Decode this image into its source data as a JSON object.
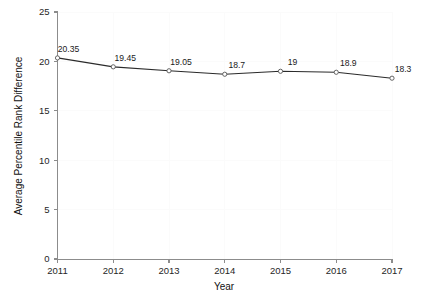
{
  "chart_data": {
    "type": "line",
    "title": "",
    "xlabel": "Year",
    "ylabel": "Average Percentile Rank Difference",
    "categories": [
      "2011",
      "2012",
      "2013",
      "2014",
      "2015",
      "2016",
      "2017"
    ],
    "values": [
      20.35,
      19.45,
      19.05,
      18.7,
      19,
      18.9,
      18.3
    ],
    "point_labels": [
      "20.35",
      "19.45",
      "19.05",
      "18.7",
      "19",
      "18.9",
      "18.3"
    ],
    "ylim": [
      0,
      25
    ],
    "y_ticks": [
      "0",
      "5",
      "10",
      "15",
      "20",
      "25"
    ],
    "y_tick_values": [
      0,
      5,
      10,
      15,
      20,
      25
    ],
    "x_ticks": [
      "2011",
      "2012",
      "2013",
      "2014",
      "2015",
      "2016",
      "2017"
    ],
    "grid": true,
    "legend": "none",
    "series": [
      {
        "name": "Average Percentile Rank Difference",
        "values": [
          20.35,
          19.45,
          19.05,
          18.7,
          19,
          18.9,
          18.3
        ]
      }
    ],
    "colors": {
      "line": "#2b2b2b",
      "marker_fill": "#ffffff",
      "marker_stroke": "#555555",
      "axis": "#8c8c8c",
      "grid": "#fbfbfb",
      "text": "#1a1a1a",
      "background": "#ffffff"
    }
  }
}
